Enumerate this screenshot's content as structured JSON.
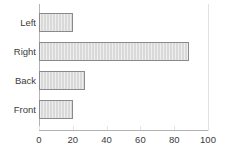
{
  "chart_data": {
    "type": "bar",
    "orientation": "horizontal",
    "title": "",
    "subtitle": "",
    "xlabel": "",
    "ylabel": "",
    "categories": [
      "Left",
      "Right",
      "Back",
      "Front"
    ],
    "values": [
      20,
      89,
      27,
      20
    ],
    "xlim": [
      0,
      100
    ],
    "xticks": [
      0,
      20,
      40,
      60,
      80,
      100
    ],
    "xtick_labels": [
      "0",
      "20",
      "40",
      "60",
      "80",
      "100"
    ],
    "grid": false,
    "legend": false,
    "legend_position": "none",
    "series": [
      {
        "name": "",
        "values": [
          20,
          89,
          27,
          20
        ]
      }
    ],
    "annotations": []
  },
  "style": {
    "bar_fill": "#d9d9d9",
    "bar_border": "#8a8a8a",
    "axis_color": "#b4b4b4",
    "frame_color": "#e2e2e2",
    "text_color": "#3b3b3b",
    "background": "#ffffff"
  }
}
